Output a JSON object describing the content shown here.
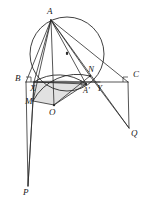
{
  "figure": {
    "kind": "euclidean-geometry-diagram",
    "width": 150,
    "height": 208,
    "background_color": "#ffffff",
    "stroke_color": "#2b2b2b",
    "shade_fill_color": "#c9c9c9",
    "shade_opacity": 0.55
  },
  "points": [
    {
      "id": "A",
      "label": "A",
      "x": 51,
      "y": 20,
      "label_x": 47,
      "label_y": 7,
      "size": "normal"
    },
    {
      "id": "B",
      "label": "B",
      "x": 26,
      "y": 82,
      "label_x": 15,
      "label_y": 74,
      "size": "normal"
    },
    {
      "id": "C",
      "label": "C",
      "x": 128,
      "y": 82,
      "label_x": 133,
      "label_y": 70,
      "size": "normal"
    },
    {
      "id": "X",
      "label": "X",
      "x": 34,
      "y": 82,
      "label_x": 30,
      "label_y": 84,
      "size": "normal"
    },
    {
      "id": "Y",
      "label": "Y",
      "x": 100,
      "y": 82,
      "label_x": 97,
      "label_y": 84,
      "size": "normal"
    },
    {
      "id": "M",
      "label": "M",
      "x": 33,
      "y": 101,
      "label_x": 25,
      "label_y": 97,
      "size": "normal"
    },
    {
      "id": "N",
      "label": "N",
      "x": 90,
      "y": 76,
      "label_x": 88,
      "label_y": 65,
      "size": "normal"
    },
    {
      "id": "O",
      "label": "O",
      "x": 54,
      "y": 105,
      "label_x": 49,
      "label_y": 108,
      "size": "normal"
    },
    {
      "id": "Aprime",
      "label": "A'",
      "x": 86,
      "y": 84,
      "label_x": 83,
      "label_y": 87,
      "size": "small"
    },
    {
      "id": "P",
      "label": "P",
      "x": 28,
      "y": 186,
      "label_x": 23,
      "label_y": 188,
      "size": "normal"
    },
    {
      "id": "Q",
      "label": "Q",
      "x": 129,
      "y": 128,
      "label_x": 131,
      "label_y": 129,
      "size": "normal"
    }
  ],
  "circle": {
    "center_x": 67,
    "center_y": 54,
    "radius": 37,
    "center_dot": true,
    "center_dot_radius": 1.1
  },
  "segments": [
    {
      "name": "line-BC",
      "from": "B",
      "to": "C"
    },
    {
      "name": "line-AB",
      "from": "A",
      "to": "B"
    },
    {
      "name": "line-AX",
      "from": "A",
      "to": "X"
    },
    {
      "name": "line-AM",
      "from": "A",
      "to": "M"
    },
    {
      "name": "line-AO",
      "from": "A",
      "to": "O"
    },
    {
      "name": "line-AN",
      "from": "A",
      "to": "N"
    },
    {
      "name": "line-AAprime",
      "from": "A",
      "to": "Aprime"
    },
    {
      "name": "line-AQ",
      "from": "A",
      "to": "Q"
    },
    {
      "name": "line-AC",
      "from": "A",
      "to": "C"
    },
    {
      "name": "line-XY",
      "from": "X",
      "to": "Y"
    },
    {
      "name": "line-XM",
      "from": "X",
      "to": "M"
    },
    {
      "name": "line-MO",
      "from": "M",
      "to": "O"
    },
    {
      "name": "line-ON",
      "from": "O",
      "to": "N"
    },
    {
      "name": "line-OAprime",
      "from": "O",
      "to": "Aprime"
    },
    {
      "name": "line-XAprime",
      "from": "X",
      "to": "Aprime"
    },
    {
      "name": "line-MP",
      "from": "M",
      "to": "P"
    },
    {
      "name": "line-XP",
      "from": "X",
      "to": "P"
    },
    {
      "name": "line-NQ",
      "from": "N",
      "to": "Q"
    },
    {
      "name": "line-CQ",
      "from": "C",
      "to": "Q"
    },
    {
      "name": "line-BP-vertical",
      "from": "B",
      "to": "P"
    }
  ],
  "arcs": [
    {
      "name": "arc-X-to-Aprime",
      "from": "X",
      "to": "Aprime",
      "sweep": 1,
      "rx": 46,
      "ry": 46
    },
    {
      "name": "arc-M-to-N",
      "from": "M",
      "to": "N",
      "sweep": 1,
      "rx": 50,
      "ry": 50
    }
  ],
  "shaded_region": {
    "name": "shaded-curvilinear-region",
    "vertices": [
      "X",
      "M",
      "O",
      "Aprime"
    ]
  },
  "right_angle_marks": [
    {
      "name": "right-angle-at-B",
      "x": 26,
      "y": 82,
      "dx": 1,
      "dy": -1
    },
    {
      "name": "right-angle-at-C",
      "x": 128,
      "y": 82,
      "dx": -1,
      "dy": -1
    },
    {
      "name": "right-angle-at-Aprime",
      "x": 86,
      "y": 80,
      "dx": -1,
      "dy": 1
    }
  ],
  "marked_points": [
    {
      "name": "dot-O",
      "x": 54,
      "y": 105
    },
    {
      "name": "dot-center",
      "x": 67,
      "y": 53
    },
    {
      "name": "dot-Aprime",
      "x": 86,
      "y": 84
    },
    {
      "name": "dot-N",
      "x": 90,
      "y": 76
    }
  ]
}
